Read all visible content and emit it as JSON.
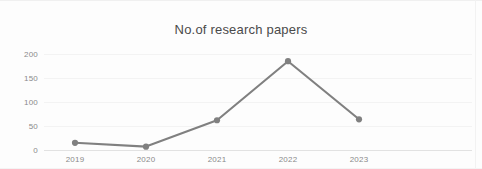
{
  "chart_data": {
    "type": "line",
    "title": "No.of research papers",
    "xlabel": "",
    "ylabel": "",
    "categories": [
      "2019",
      "2020",
      "2021",
      "2022",
      "2023"
    ],
    "values": [
      15,
      7,
      62,
      185,
      64
    ],
    "series": [
      {
        "name": "No.of research papers",
        "values": [
          15,
          7,
          62,
          185,
          64
        ]
      }
    ],
    "ylim": [
      0,
      200
    ],
    "yticks": [
      "0",
      "50",
      "100",
      "150",
      "200"
    ],
    "ytick_values": [
      0,
      50,
      100,
      150,
      200
    ],
    "xticks": [
      "2019",
      "2020",
      "2021",
      "2022",
      "2023"
    ],
    "grid": true,
    "legend": "none",
    "line_color": "#808080",
    "marker_color": "#808080",
    "marker": "circle",
    "text_color": "#8a8a8a",
    "title_color": "#4a4a4a",
    "background_color": "#fdfdfd"
  }
}
